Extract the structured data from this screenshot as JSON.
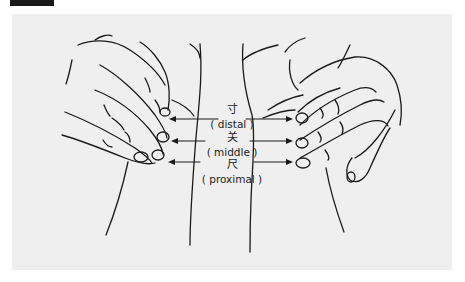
{
  "figure": {
    "panel_color": "#efefef",
    "line_color": "#1a1a1a",
    "positions": [
      {
        "chinese": "寸",
        "english": "( distal )"
      },
      {
        "chinese": "关",
        "english": "( middle )"
      },
      {
        "chinese": "尺",
        "english": "( proximal )"
      }
    ]
  }
}
